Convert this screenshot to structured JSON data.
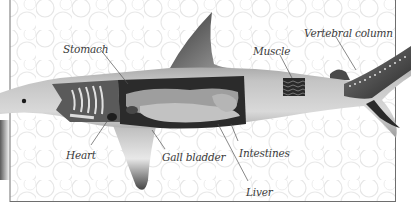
{
  "diagram": {
    "labels": [
      {
        "id": "stomach",
        "text": "Stomach",
        "x": 63,
        "y": 43
      },
      {
        "id": "muscle",
        "text": "Muscle",
        "x": 253,
        "y": 45
      },
      {
        "id": "vertebral-column",
        "text": "Vertebral column",
        "x": 304,
        "y": 27
      },
      {
        "id": "heart",
        "text": "Heart",
        "x": 66,
        "y": 149
      },
      {
        "id": "gall-bladder",
        "text": "Gall bladder",
        "x": 162,
        "y": 151
      },
      {
        "id": "intestines",
        "text": "Intestines",
        "x": 239,
        "y": 147
      },
      {
        "id": "liver",
        "text": "Liver",
        "x": 246,
        "y": 186
      }
    ],
    "colors": {
      "background": "#ffffff",
      "bubble_line": "#e3e3e3",
      "body_light": "#c9c9c9",
      "body_dark": "#5a5a5a",
      "cavity": "#2b2b2b",
      "organ": "#a8a8a8",
      "frame": "#6e6e6e",
      "label_text": "#3a3a3a",
      "leader_line": "#555555"
    }
  }
}
